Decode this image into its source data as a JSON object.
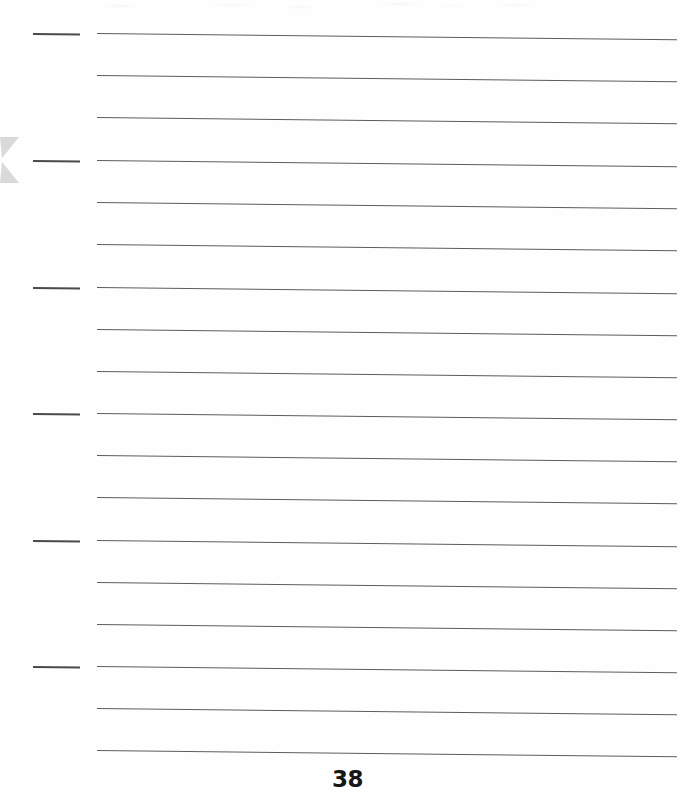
{
  "page": {
    "kind": "ruled-notebook-page",
    "width": 695,
    "height": 805,
    "background_color": "#fefefe",
    "page_number": "38",
    "page_number_color": "#171717"
  },
  "rules": {
    "label": "ruled writing lines",
    "count": 18,
    "color": "#5c5c60",
    "thickness_px": 1,
    "left_x": 97,
    "right_x": 677,
    "first_y": 33,
    "spacing_px": 42.2,
    "skew_deg": 0.62,
    "lines": [
      {
        "index": 1,
        "y": 33
      },
      {
        "index": 2,
        "y": 75
      },
      {
        "index": 3,
        "y": 117
      },
      {
        "index": 4,
        "y": 160
      },
      {
        "index": 5,
        "y": 202
      },
      {
        "index": 6,
        "y": 244
      },
      {
        "index": 7,
        "y": 287
      },
      {
        "index": 8,
        "y": 329
      },
      {
        "index": 9,
        "y": 371
      },
      {
        "index": 10,
        "y": 413
      },
      {
        "index": 11,
        "y": 455
      },
      {
        "index": 12,
        "y": 497
      },
      {
        "index": 13,
        "y": 540
      },
      {
        "index": 14,
        "y": 582
      },
      {
        "index": 15,
        "y": 624
      },
      {
        "index": 16,
        "y": 666
      },
      {
        "index": 17,
        "y": 708
      },
      {
        "index": 18,
        "y": 750
      }
    ]
  },
  "margin_ticks": {
    "label": "short left margin tick marks",
    "count": 6,
    "color": "#4a4a4e",
    "thickness_px": 2,
    "left_x": 33,
    "right_x": 80,
    "repeat_every_nth_rule": 3,
    "ticks": [
      {
        "index": 1,
        "y": 33,
        "rule_index": 1
      },
      {
        "index": 2,
        "y": 160,
        "rule_index": 4
      },
      {
        "index": 3,
        "y": 287,
        "rule_index": 7
      },
      {
        "index": 4,
        "y": 413,
        "rule_index": 10
      },
      {
        "index": 5,
        "y": 540,
        "rule_index": 13
      },
      {
        "index": 6,
        "y": 666,
        "rule_index": 16
      }
    ]
  },
  "edge_marker": {
    "label": "left edge gray double chevron marker",
    "color": "#d8d8d8",
    "x": 0,
    "y": 137,
    "width": 19,
    "height": 46
  },
  "bleed": {
    "label": "faint show-through smudges along top edge",
    "present": true,
    "color": "#78788255"
  }
}
